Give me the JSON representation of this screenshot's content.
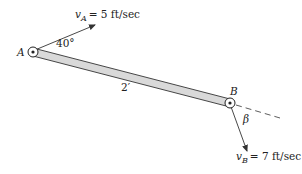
{
  "diagram": {
    "point_a": {
      "label": "A"
    },
    "point_b": {
      "label": "B"
    },
    "bar_length": "2′",
    "velocity_a": {
      "symbol": "v",
      "subscript": "A",
      "value": "= 5 ft/sec"
    },
    "velocity_b": {
      "symbol": "v",
      "subscript": "B",
      "value": "= 7 ft/sec"
    },
    "angle_a": "40°",
    "angle_b": "β",
    "colors": {
      "bar_fill": "#d9d9d9",
      "stroke": "#333333"
    }
  }
}
